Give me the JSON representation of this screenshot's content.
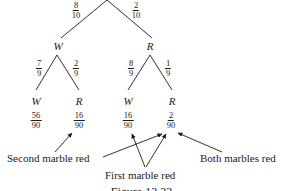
{
  "tree": {
    "level1": {
      "branches": [
        {
          "node": "W",
          "prob_num": "8",
          "prob_den": "10"
        },
        {
          "node": "R",
          "prob_num": "2",
          "prob_den": "10"
        }
      ]
    },
    "level2": {
      "W_branches": [
        {
          "node": "W",
          "prob_num": "7",
          "prob_den": "9",
          "outcome_num": "56",
          "outcome_den": "90"
        },
        {
          "node": "R",
          "prob_num": "2",
          "prob_den": "9",
          "outcome_num": "16",
          "outcome_den": "90"
        }
      ],
      "R_branches": [
        {
          "node": "W",
          "prob_num": "8",
          "prob_den": "9",
          "outcome_num": "16",
          "outcome_den": "90"
        },
        {
          "node": "R",
          "prob_num": "1",
          "prob_den": "9",
          "outcome_num": "2",
          "outcome_den": "90"
        }
      ]
    }
  },
  "annotations": {
    "second_red": "Second marble red",
    "first_red": "First marble red",
    "both_red": "Both marbles red"
  },
  "caption": "Figure 13.33",
  "colors": {
    "ink": "#1a1a1a",
    "background": "#ffffff"
  }
}
